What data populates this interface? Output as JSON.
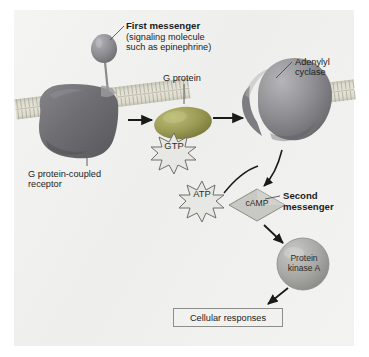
{
  "figure": {
    "background_color": "#f2f2f0",
    "frame_color": "#ffffff"
  },
  "labels": {
    "first_messenger": "First messenger",
    "first_messenger_detail": "(signaling molecule\nsuch as epinephrine)",
    "g_protein": "G protein",
    "adenylyl_cyclase": "Adenylyl\ncyclase",
    "receptor": "G protein-coupled\nreceptor",
    "second_messenger": "Second\nmessenger"
  },
  "molecules": {
    "gtp": "GTP",
    "atp": "ATP",
    "camp": "cAMP",
    "protein_kinase_a": "Protein\nkinase A"
  },
  "outcome": {
    "cellular_responses": "Cellular responses"
  },
  "colors": {
    "membrane_head": "#b9b7a8",
    "membrane_core": "#d8d6c8",
    "receptor_body": "#6f6f72",
    "g_protein": "#9a9a54",
    "cyclase": "#8f8f92",
    "ligand": "#8a8a8e",
    "burst_fill": "#e7e7e3",
    "burst_stroke": "#6e6e6b",
    "camp_diamond": "#c9c9c4",
    "kinase_circle": "#a9a9a6",
    "arrow": "#1a1a18",
    "text": "#1d1d1b",
    "box_border": "#8d8d8a"
  },
  "icons": {
    "gtp_burst": "starburst-icon",
    "atp_burst": "starburst-icon",
    "camp_diamond": "diamond-icon",
    "kinase_circle": "circle-icon",
    "ligand": "teardrop-icon",
    "activation_arrow": "arrow-right-icon",
    "conversion_arrow": "curved-arrow-icon"
  }
}
